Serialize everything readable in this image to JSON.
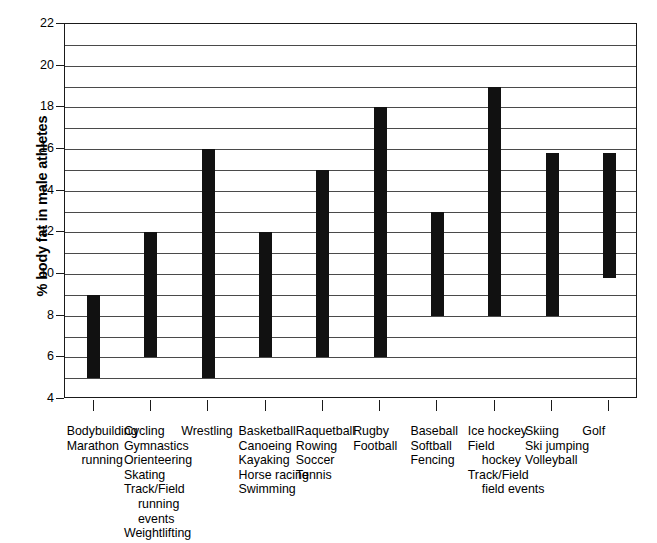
{
  "chart_data": {
    "type": "bar",
    "bar_style": "floating-range-bars",
    "title": "",
    "subtitle": "",
    "xlabel": "",
    "ylabel": "% body fat in male athletes",
    "ylim": [
      4,
      22
    ],
    "ytick_step": 2,
    "gridline_step": 1,
    "grid": true,
    "legend": "none",
    "yticks": [
      4,
      6,
      8,
      10,
      12,
      14,
      16,
      18,
      20,
      22
    ],
    "ytick_labels": [
      "4",
      "6",
      "8",
      "10",
      "12",
      "14",
      "16",
      "18",
      "20",
      "22"
    ],
    "categories": [
      "Bodybuilding / Marathon running",
      "Cycling / Gymnastics / Orienteering / Skating / Track/Field running events / Weightlifting",
      "Wrestling",
      "Basketball / Canoeing / Kayaking / Horse racing / Swimming",
      "Raquetball / Rowing / Soccer / Tennis",
      "Rugby / Football",
      "Baseball / Softball / Fencing",
      "Ice hockey / Field hockey / Track/Field field events",
      "Skiing / Ski jumping / Volleyball",
      "Golf"
    ],
    "low": [
      5.0,
      6.0,
      5.0,
      6.0,
      6.0,
      6.0,
      8.0,
      8.0,
      8.0,
      9.8
    ],
    "high": [
      9.0,
      12.0,
      16.0,
      12.0,
      15.0,
      18.0,
      13.0,
      19.0,
      15.8,
      15.8
    ],
    "bar_color": "#111111",
    "axis_color": "#1a1a1a",
    "grid_color": "#4a4a4a",
    "background_color": "#ffffff"
  },
  "axis": {
    "y_title": "% body fat in male athletes"
  },
  "x_categories": [
    {
      "lines": [
        {
          "text": "Bodybuilding",
          "style": "normal"
        },
        {
          "text": "Marathon",
          "style": "normal"
        },
        {
          "text": "running",
          "style": "center"
        }
      ]
    },
    {
      "lines": [
        {
          "text": "Cycling",
          "style": "normal"
        },
        {
          "text": "Gymnastics",
          "style": "normal"
        },
        {
          "text": "Orienteering",
          "style": "normal"
        },
        {
          "text": "Skating",
          "style": "normal"
        },
        {
          "text": "Track/Field",
          "style": "normal"
        },
        {
          "text": "running",
          "style": "indent"
        },
        {
          "text": "events",
          "style": "indent"
        },
        {
          "text": "Weightlifting",
          "style": "normal"
        }
      ]
    },
    {
      "lines": [
        {
          "text": "Wrestling",
          "style": "normal"
        }
      ]
    },
    {
      "lines": [
        {
          "text": "Basketball",
          "style": "normal"
        },
        {
          "text": "Canoeing",
          "style": "normal"
        },
        {
          "text": "Kayaking",
          "style": "normal"
        },
        {
          "text": "Horse racing",
          "style": "normal"
        },
        {
          "text": "Swimming",
          "style": "normal"
        }
      ]
    },
    {
      "lines": [
        {
          "text": "Raquetball",
          "style": "normal"
        },
        {
          "text": "Rowing",
          "style": "normal"
        },
        {
          "text": "Soccer",
          "style": "normal"
        },
        {
          "text": "Tennis",
          "style": "normal"
        }
      ]
    },
    {
      "lines": [
        {
          "text": "Rugby",
          "style": "normal"
        },
        {
          "text": "Football",
          "style": "normal"
        }
      ]
    },
    {
      "lines": [
        {
          "text": "Baseball",
          "style": "normal"
        },
        {
          "text": "Softball",
          "style": "normal"
        },
        {
          "text": "Fencing",
          "style": "normal"
        }
      ]
    },
    {
      "lines": [
        {
          "text": "Ice hockey",
          "style": "normal"
        },
        {
          "text": "Field",
          "style": "normal"
        },
        {
          "text": "hockey",
          "style": "indent"
        },
        {
          "text": "Track/Field",
          "style": "normal"
        },
        {
          "text": "field events",
          "style": "indent"
        }
      ]
    },
    {
      "lines": [
        {
          "text": "Skiing",
          "style": "normal"
        },
        {
          "text": "Ski jumping",
          "style": "normal"
        },
        {
          "text": "Volleyball",
          "style": "normal"
        }
      ]
    },
    {
      "lines": [
        {
          "text": "Golf",
          "style": "normal"
        }
      ]
    }
  ]
}
